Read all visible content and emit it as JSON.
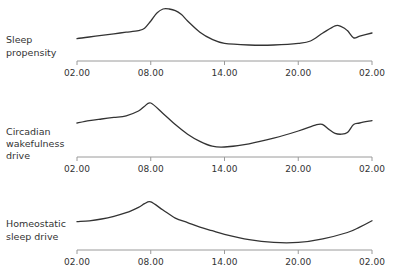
{
  "chart_data": [
    {
      "type": "line",
      "title": "Sleep propensity",
      "ylabel_lines": [
        "Sleep",
        "propensity"
      ],
      "xlabel": "",
      "x_ticks": [
        "02.00",
        "08.00",
        "14.00",
        "20.00",
        "02.00"
      ],
      "x_hours": [
        2,
        3,
        4,
        5,
        6,
        7,
        7.5,
        8,
        8.5,
        9,
        9.5,
        10,
        10.5,
        11,
        12,
        13,
        14,
        16,
        18,
        20,
        21,
        22,
        23,
        23.5,
        24,
        24.5,
        25,
        26
      ],
      "values": [
        18,
        20,
        22,
        24,
        26,
        28,
        31,
        40,
        50,
        55,
        55,
        53,
        48,
        40,
        26,
        17,
        12,
        10,
        10,
        12,
        15,
        25,
        34,
        33,
        28,
        19,
        21,
        25
      ],
      "y_axis": "relative (no scale shown)",
      "grid": false
    },
    {
      "type": "line",
      "title": "Circadian wakefulness drive",
      "ylabel_lines": [
        "Circadian",
        "wakefulness",
        "drive"
      ],
      "xlabel": "",
      "x_ticks": [
        "02.00",
        "08.00",
        "14.00",
        "20.00",
        "02.00"
      ],
      "x_hours": [
        2,
        3,
        4,
        5,
        6,
        7,
        7.5,
        8,
        9,
        10,
        11,
        12,
        13,
        14,
        16,
        18,
        20,
        21.5,
        22,
        22.5,
        23,
        23.5,
        24,
        24.5,
        25,
        26
      ],
      "values": [
        35,
        38,
        40,
        42,
        44,
        50,
        56,
        60,
        47,
        33,
        21,
        12,
        6,
        5,
        9,
        16,
        25,
        33,
        33,
        27,
        22,
        21,
        23,
        33,
        35,
        38
      ],
      "y_axis": "relative (no scale shown)",
      "grid": false
    },
    {
      "type": "line",
      "title": "Homeostatic sleep drive",
      "ylabel_lines": [
        "Homeostatic",
        "sleep drive"
      ],
      "xlabel": "",
      "x_ticks": [
        "02.00",
        "08.00",
        "14.00",
        "20.00",
        "02.00"
      ],
      "x_hours": [
        2,
        3,
        4,
        5,
        6,
        7,
        7.5,
        8,
        9,
        10,
        11,
        12,
        13,
        14,
        16,
        18,
        20,
        22,
        24,
        25,
        26
      ],
      "values": [
        27,
        28,
        30,
        33,
        37,
        43,
        47,
        49,
        40,
        31,
        26,
        21,
        17,
        13,
        7,
        4,
        4,
        8,
        15,
        21,
        28
      ],
      "y_axis": "relative (no scale shown)",
      "grid": false
    }
  ],
  "panels": [
    {
      "label_lines": [
        "Sleep",
        "propensity"
      ],
      "ticks": [
        "02.00",
        "08.00",
        "14.00",
        "20.00",
        "02.00"
      ]
    },
    {
      "label_lines": [
        "Circadian",
        "wakefulness",
        "drive"
      ],
      "ticks": [
        "02.00",
        "08.00",
        "14.00",
        "20.00",
        "02.00"
      ]
    },
    {
      "label_lines": [
        "Homeostatic",
        "sleep drive"
      ],
      "ticks": [
        "02.00",
        "08.00",
        "14.00",
        "20.00",
        "02.00"
      ]
    }
  ],
  "style": {
    "line_color": "#333333",
    "axis_color": "#9a9a9a",
    "text_color": "#333333"
  }
}
